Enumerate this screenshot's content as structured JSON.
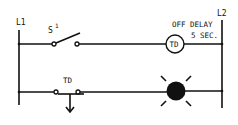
{
  "diagram": {
    "type": "ladder-diagram",
    "rails": {
      "left_label": "L1",
      "right_label": "L2"
    },
    "rungs": [
      {
        "id": "rung-1",
        "elements": [
          {
            "kind": "switch",
            "label": "S",
            "superscript": "1",
            "state": "normally-open"
          },
          {
            "kind": "coil",
            "label": "TD",
            "note_line1": "OFF DELAY",
            "note_line2": "5 SEC."
          }
        ]
      },
      {
        "id": "rung-2",
        "elements": [
          {
            "kind": "timed-contact",
            "label": "TD",
            "state": "normally-open-timed-open"
          },
          {
            "kind": "lamp",
            "label": "",
            "state": "on"
          }
        ]
      }
    ],
    "colors": {
      "ink": "#111111",
      "background": "#ffffff"
    }
  }
}
